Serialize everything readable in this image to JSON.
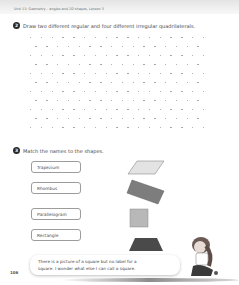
{
  "header": {
    "unit_text": "Unit 11: Geometry – angles and 2D shapes, Lesson 3"
  },
  "question2": {
    "number": "2",
    "instruction": "Draw two different regular and four different irregular quadrilaterals.",
    "dot_grid": {
      "rows": 11,
      "cols_even": 17,
      "cols_odd": 16,
      "dot_color": "#9a9a9a"
    }
  },
  "question3": {
    "number": "3",
    "instruction": "Match the names to the shapes.",
    "names": [
      "Trapezium",
      "Rhombus",
      "Parallelogram",
      "Rectangle"
    ],
    "shapes": [
      {
        "name": "parallelogram-shape",
        "color": "#e3e3e3"
      },
      {
        "name": "rotated-rectangle-shape",
        "color": "#7d7d7d"
      },
      {
        "name": "square-shape",
        "color": "#b8b8b8"
      },
      {
        "name": "trapezium-shape",
        "color": "#4a4a4a"
      }
    ]
  },
  "speech_bubble": {
    "line1": "There is a picture of a square but no label for a",
    "line2": "square. I wonder what else I can call a square."
  },
  "footer": {
    "page_number": "106"
  }
}
